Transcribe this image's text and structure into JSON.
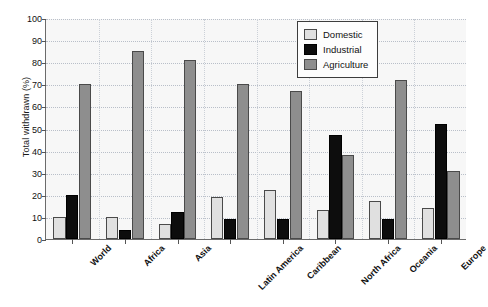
{
  "chart_data": {
    "type": "bar",
    "title": "",
    "subtitle": "",
    "xlabel": "",
    "ylabel": "Total withdrawn (%)",
    "ylim": [
      0,
      100
    ],
    "ytick_step": 10,
    "yticks": [
      0,
      10,
      20,
      30,
      40,
      50,
      60,
      70,
      80,
      90,
      100
    ],
    "grid": true,
    "grid_axis": "both",
    "legend_position": "top-right",
    "categories": [
      "World",
      "Africa",
      "Asia",
      "Latin America",
      "Caribbean",
      "North Africa",
      "Oceania",
      "Europe"
    ],
    "series": [
      {
        "name": "Domestic",
        "color": "#e0e0e0",
        "values": [
          10,
          10,
          7,
          19,
          22,
          13,
          17,
          14
        ]
      },
      {
        "name": "Industrial",
        "color": "#0d0d0d",
        "values": [
          20,
          4,
          12,
          9,
          9,
          47,
          9,
          52
        ]
      },
      {
        "name": "Agriculture",
        "color": "#8e8e8e",
        "values": [
          70,
          85,
          81,
          70,
          67,
          38,
          72,
          31
        ]
      }
    ]
  },
  "legend": {
    "items": [
      {
        "label": "Domestic",
        "swatch": "domestic"
      },
      {
        "label": "Industrial",
        "swatch": "industrial"
      },
      {
        "label": "Agriculture",
        "swatch": "agriculture"
      }
    ]
  },
  "colors": {
    "domestic": "#e0e0e0",
    "industrial": "#0d0d0d",
    "agriculture": "#8e8e8e",
    "plot_background": "#f7f7f7",
    "axis": "#6b6b6b",
    "gridline": "#b9bfc9"
  }
}
